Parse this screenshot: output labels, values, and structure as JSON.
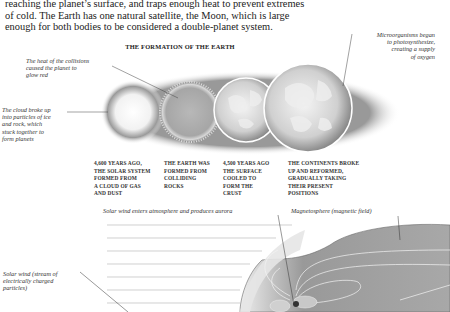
{
  "body_text": {
    "lines": [
      "reaching the planet’s surface, and traps enough heat to prevent extremes",
      "of cold. The Earth has one natural satellite, the Moon, which is large",
      "enough for both bodies to be considered a double-planet system."
    ]
  },
  "formation": {
    "title": "THE FORMATION OF THE EARTH",
    "callouts": {
      "heat": [
        "The heat of the collisions",
        "caused the planet to",
        "glow red"
      ],
      "cloud": [
        "The cloud broke up",
        "into particles of ice",
        "and rock, which",
        "stuck together to",
        "form planets"
      ],
      "micro": [
        "Microorganisms began",
        "to photosynthesize,",
        "creating a supply",
        "of oxygen"
      ]
    },
    "stages": [
      {
        "lines": [
          "4,600 YEARS AGO,",
          "THE SOLAR SYSTEM",
          "FORMED FROM",
          "A CLOUD OF GAS",
          "AND DUST"
        ]
      },
      {
        "lines": [
          "THE EARTH WAS",
          "FORMED FROM",
          "COLLIDING",
          "ROCKS"
        ]
      },
      {
        "lines": [
          "4,500 YEARS AGO",
          "THE SURFACE",
          "COOLED TO",
          "FORM THE",
          "CRUST"
        ]
      },
      {
        "lines": [
          "THE CONTINENTS BROKE",
          "UP AND REFORMED,",
          "GRADUALLY TAKING",
          "THEIR PRESENT",
          "POSITIONS"
        ]
      }
    ]
  },
  "magnetosphere": {
    "aurora_label": "Solar wind enters atmosphere and produces aurora",
    "magnetosphere_label": "Magnetosphere (magnetic field)",
    "solar_wind_label": [
      "Solar wind (stream of",
      "electrically charged",
      "particles)"
    ]
  }
}
